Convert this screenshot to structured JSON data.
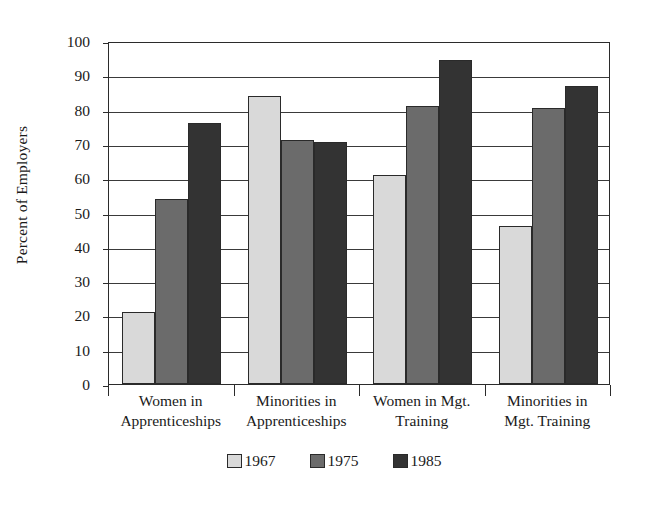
{
  "chart_data": {
    "type": "bar",
    "title": "",
    "xlabel": "",
    "ylabel": "Percent of Employers",
    "ylim": [
      0,
      100
    ],
    "ytick_step": 10,
    "yticks": [
      0,
      10,
      20,
      30,
      40,
      50,
      60,
      70,
      80,
      90,
      100
    ],
    "grid": true,
    "legend_position": "bottom",
    "categories": [
      "Women in Apprenticeships",
      "Minorities in Apprenticeships",
      "Women in Mgt. Training",
      "Minorities in Mgt. Training"
    ],
    "category_lines": [
      [
        "Women in",
        "Apprenticeships"
      ],
      [
        "Minorities in",
        "Apprenticeships"
      ],
      [
        "Women in Mgt.",
        "Training"
      ],
      [
        "Minorities in",
        "Mgt. Training"
      ]
    ],
    "series": [
      {
        "name": "1967",
        "color": "#d9d9d9",
        "values": [
          21,
          84,
          61,
          46
        ]
      },
      {
        "name": "1975",
        "color": "#6b6b6b",
        "values": [
          54,
          71,
          81,
          80.5
        ]
      },
      {
        "name": "1985",
        "color": "#333333",
        "values": [
          76,
          70.5,
          94.5,
          87
        ]
      }
    ]
  },
  "legend": {
    "items": [
      {
        "label": "1967",
        "color": "#d9d9d9"
      },
      {
        "label": "1975",
        "color": "#6b6b6b"
      },
      {
        "label": "1985",
        "color": "#333333"
      }
    ]
  }
}
